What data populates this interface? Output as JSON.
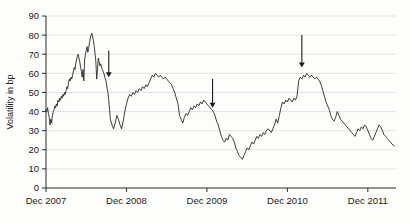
{
  "chart_data": {
    "type": "line",
    "title": "",
    "xlabel": "",
    "ylabel": "Volatility in bp",
    "ylim": [
      0,
      90
    ],
    "ytick_values": [
      0,
      10,
      20,
      30,
      40,
      50,
      60,
      70,
      80,
      90
    ],
    "ytick_labels": [
      "0",
      "10",
      "20",
      "30",
      "40",
      "50",
      "60",
      "70",
      "80",
      "90"
    ],
    "xtick_labels": [
      "Dec 2007",
      "Dec 2008",
      "Dec 2009",
      "Dec 2010",
      "Dec 2011"
    ],
    "xtick_positions": [
      0.0,
      1.0,
      2.0,
      3.0,
      4.0
    ],
    "xlim": [
      0.0,
      4.35
    ],
    "grid": "horizontal",
    "legend": "none",
    "line_color": "#1c1c1c",
    "series": [
      {
        "name": "Volatility in bp",
        "x": [
          0.0,
          0.01,
          0.02,
          0.03,
          0.04,
          0.05,
          0.06,
          0.07,
          0.08,
          0.09,
          0.1,
          0.11,
          0.12,
          0.13,
          0.14,
          0.15,
          0.16,
          0.17,
          0.18,
          0.19,
          0.2,
          0.21,
          0.22,
          0.23,
          0.24,
          0.25,
          0.26,
          0.27,
          0.28,
          0.29,
          0.3,
          0.31,
          0.32,
          0.33,
          0.34,
          0.35,
          0.36,
          0.37,
          0.38,
          0.39,
          0.4,
          0.41,
          0.42,
          0.43,
          0.44,
          0.45,
          0.46,
          0.47,
          0.48,
          0.49,
          0.5,
          0.51,
          0.52,
          0.53,
          0.54,
          0.55,
          0.56,
          0.57,
          0.58,
          0.59,
          0.6,
          0.61,
          0.62,
          0.63,
          0.64,
          0.65,
          0.66,
          0.67,
          0.68,
          0.69,
          0.7,
          0.71,
          0.72,
          0.73,
          0.74,
          0.75,
          0.76,
          0.77,
          0.78,
          0.79,
          0.8,
          0.82,
          0.84,
          0.86,
          0.88,
          0.9,
          0.92,
          0.94,
          0.96,
          0.98,
          1.0,
          1.02,
          1.04,
          1.06,
          1.08,
          1.1,
          1.12,
          1.14,
          1.16,
          1.18,
          1.2,
          1.22,
          1.24,
          1.26,
          1.28,
          1.3,
          1.32,
          1.34,
          1.36,
          1.38,
          1.4,
          1.42,
          1.44,
          1.46,
          1.48,
          1.5,
          1.52,
          1.54,
          1.56,
          1.58,
          1.6,
          1.62,
          1.64,
          1.66,
          1.68,
          1.7,
          1.72,
          1.74,
          1.76,
          1.78,
          1.8,
          1.82,
          1.84,
          1.86,
          1.88,
          1.9,
          1.92,
          1.94,
          1.96,
          1.98,
          2.0,
          2.02,
          2.04,
          2.06,
          2.08,
          2.1,
          2.12,
          2.14,
          2.16,
          2.18,
          2.2,
          2.22,
          2.24,
          2.26,
          2.28,
          2.3,
          2.32,
          2.34,
          2.36,
          2.38,
          2.4,
          2.42,
          2.44,
          2.46,
          2.48,
          2.5,
          2.52,
          2.54,
          2.56,
          2.58,
          2.6,
          2.62,
          2.64,
          2.66,
          2.68,
          2.7,
          2.72,
          2.74,
          2.76,
          2.78,
          2.8,
          2.82,
          2.84,
          2.86,
          2.88,
          2.9,
          2.92,
          2.94,
          2.96,
          2.98,
          3.0,
          3.02,
          3.04,
          3.06,
          3.08,
          3.1,
          3.12,
          3.14,
          3.16,
          3.18,
          3.2,
          3.22,
          3.24,
          3.26,
          3.28,
          3.3,
          3.32,
          3.34,
          3.36,
          3.38,
          3.4,
          3.42,
          3.44,
          3.46,
          3.48,
          3.5,
          3.52,
          3.54,
          3.56,
          3.58,
          3.6,
          3.62,
          3.64,
          3.66,
          3.68,
          3.7,
          3.72,
          3.74,
          3.76,
          3.78,
          3.8,
          3.82,
          3.84,
          3.86,
          3.88,
          3.9,
          3.92,
          3.94,
          3.96,
          3.98,
          4.0,
          4.02,
          4.04,
          4.06,
          4.08,
          4.1,
          4.12,
          4.14,
          4.16,
          4.18,
          4.2,
          4.22,
          4.24,
          4.26,
          4.28,
          4.3,
          4.33
        ],
        "values": [
          41,
          40,
          42,
          39,
          37,
          33,
          36,
          34,
          38,
          40,
          41,
          43,
          42,
          44,
          43,
          46,
          45,
          47,
          46,
          48,
          47,
          49,
          48,
          50,
          49,
          51,
          53,
          52,
          55,
          57,
          56,
          58,
          57,
          59,
          61,
          63,
          62,
          65,
          67,
          69,
          70,
          68,
          66,
          63,
          61,
          58,
          62,
          56,
          67,
          70,
          72,
          74,
          71,
          73,
          76,
          78,
          80,
          81,
          79,
          77,
          74,
          70,
          66,
          57,
          62,
          68,
          66,
          64,
          65,
          63,
          62,
          61,
          60,
          58,
          57,
          55,
          52,
          50,
          46,
          41,
          36,
          33,
          31,
          34,
          38,
          36,
          33,
          31,
          35,
          40,
          44,
          47,
          49,
          48,
          50,
          49,
          51,
          50,
          52,
          51,
          53,
          52,
          54,
          53,
          55,
          57,
          59,
          58,
          60,
          59,
          58,
          59,
          58,
          57,
          58,
          57,
          56,
          55,
          54,
          52,
          50,
          47,
          44,
          38,
          36,
          34,
          37,
          39,
          38,
          40,
          42,
          41,
          43,
          42,
          44,
          43,
          45,
          44,
          46,
          45,
          44,
          43,
          42,
          41,
          40,
          38,
          35,
          33,
          30,
          27,
          25,
          24,
          26,
          25,
          28,
          27,
          26,
          24,
          21,
          19,
          17,
          16,
          15,
          17,
          19,
          21,
          20,
          22,
          24,
          23,
          25,
          27,
          26,
          28,
          27,
          29,
          28,
          30,
          31,
          30,
          29,
          31,
          33,
          36,
          34,
          38,
          42,
          45,
          44,
          46,
          45,
          47,
          46,
          45,
          47,
          46,
          48,
          56,
          58,
          57,
          59,
          58,
          60,
          59,
          58,
          59,
          58,
          57,
          58,
          57,
          56,
          54,
          51,
          48,
          45,
          43,
          41,
          38,
          36,
          35,
          37,
          40,
          38,
          36,
          35,
          34,
          33,
          32,
          31,
          30,
          29,
          28,
          27,
          29,
          31,
          30,
          32,
          31,
          33,
          32,
          30,
          28,
          26,
          25,
          27,
          29,
          31,
          33,
          32,
          30,
          28,
          27,
          26,
          25,
          24,
          23,
          22
        ]
      }
    ],
    "annotations": [
      {
        "id": "arrow-1",
        "type": "down-arrow",
        "x": 0.78,
        "y_top": 72,
        "y_tip": 58
      },
      {
        "id": "arrow-2",
        "type": "down-arrow",
        "x": 2.07,
        "y_top": 57,
        "y_tip": 42
      },
      {
        "id": "arrow-3",
        "type": "down-arrow",
        "x": 3.18,
        "y_top": 80,
        "y_tip": 63
      }
    ]
  }
}
